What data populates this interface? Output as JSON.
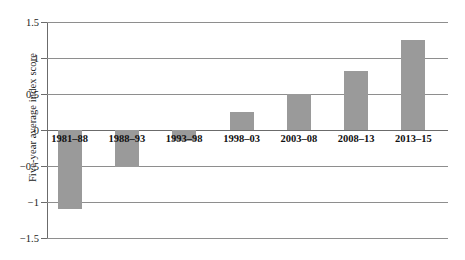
{
  "chart_data": {
    "type": "bar",
    "title": "",
    "xlabel": "",
    "ylabel": "Five-year average index score",
    "categories": [
      "1981–88",
      "1988–93",
      "1993–98",
      "1998–03",
      "2003–08",
      "2008–13",
      "2013–15"
    ],
    "values": [
      -1.1,
      -0.52,
      -0.15,
      0.25,
      0.5,
      0.82,
      1.25
    ],
    "ylim": [
      -1.5,
      1.5
    ],
    "yticks": [
      1.5,
      1,
      0.5,
      0,
      -0.5,
      -1,
      -1.5
    ],
    "ytick_labels": [
      "1.5",
      "1",
      "0.5",
      "0",
      "−0.5",
      "−1",
      "−1.5"
    ],
    "grid": true,
    "legend": "none",
    "bar_color": "#9a9a9a",
    "axis_color": "#6b6b6b",
    "gridline_color": "#8e8e8e"
  }
}
